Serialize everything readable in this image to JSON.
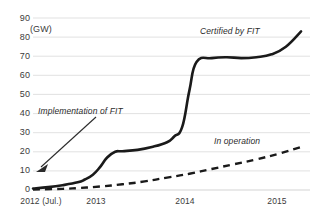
{
  "chart_data": {
    "type": "line",
    "title": "",
    "subtitle": "",
    "xlabel": "",
    "ylabel": "(GW)",
    "unit": "(GW)",
    "ylim": [
      0,
      90
    ],
    "xlim": [
      2012.5,
      2015.6
    ],
    "grid": true,
    "legend_position": "inline-annotations",
    "yticks": [
      0,
      10,
      20,
      30,
      40,
      50,
      60,
      70,
      80,
      90
    ],
    "ytick_labels": [
      "0",
      "10",
      "20",
      "30",
      "40",
      "50",
      "60",
      "70",
      "80",
      "90"
    ],
    "xticks": [
      2012.5,
      2013.0,
      2014.0,
      2015.0
    ],
    "xtick_labels": [
      "2012 (Jul.)",
      "2013",
      "2014",
      "2015"
    ],
    "series": [
      {
        "name": "Certified by FIT",
        "style": "solid",
        "color": "#1a1a1a",
        "x": [
          2012.5,
          2012.67,
          2012.83,
          2013.0,
          2013.08,
          2013.17,
          2013.25,
          2013.33,
          2013.42,
          2013.5,
          2013.67,
          2013.83,
          2014.0,
          2014.08,
          2014.17,
          2014.25,
          2014.33,
          2014.5,
          2014.67,
          2014.83,
          2015.0,
          2015.17,
          2015.33,
          2015.5
        ],
        "values": [
          0.8,
          1.5,
          2.5,
          4.0,
          5.5,
          8.0,
          12.0,
          17.0,
          20.0,
          20.3,
          21.0,
          22.5,
          25.0,
          28.0,
          33.0,
          52.0,
          67.0,
          69.0,
          69.5,
          69.0,
          69.5,
          71.0,
          75.0,
          83.0
        ]
      },
      {
        "name": "In operation",
        "style": "dashed",
        "color": "#1a1a1a",
        "x": [
          2012.5,
          2012.83,
          2013.0,
          2013.25,
          2013.5,
          2013.75,
          2014.0,
          2014.25,
          2014.5,
          2014.75,
          2015.0,
          2015.25,
          2015.5
        ],
        "values": [
          0.3,
          0.6,
          1.0,
          1.8,
          3.0,
          4.5,
          6.5,
          8.5,
          11.0,
          13.5,
          16.0,
          19.0,
          22.5
        ]
      }
    ],
    "annotations": [
      {
        "text": "Implementation of FIT",
        "x": 2012.9,
        "y": 41,
        "style": "italic",
        "arrow_to": {
          "x": 2012.62,
          "y": 10
        }
      },
      {
        "text": "Certified by FIT",
        "x": 2014.35,
        "y": 85,
        "style": "italic"
      },
      {
        "text": "In operation",
        "x": 2014.55,
        "y": 28,
        "style": "italic"
      }
    ]
  },
  "axis": {
    "unit_label": "(GW)",
    "y_labels": [
      "90",
      "80",
      "70",
      "60",
      "50",
      "40",
      "30",
      "20",
      "10",
      "0"
    ],
    "x_labels": [
      "2012 (Jul.)",
      "2013",
      "2014",
      "2015"
    ]
  },
  "annotations": {
    "implementation": "Implementation of FIT",
    "certified": "Certified by FIT",
    "in_operation": "In operation"
  },
  "colors": {
    "line": "#1a1a1a",
    "grid": "#d9d9d9",
    "text": "#3b3b3b",
    "background": "#ffffff"
  }
}
